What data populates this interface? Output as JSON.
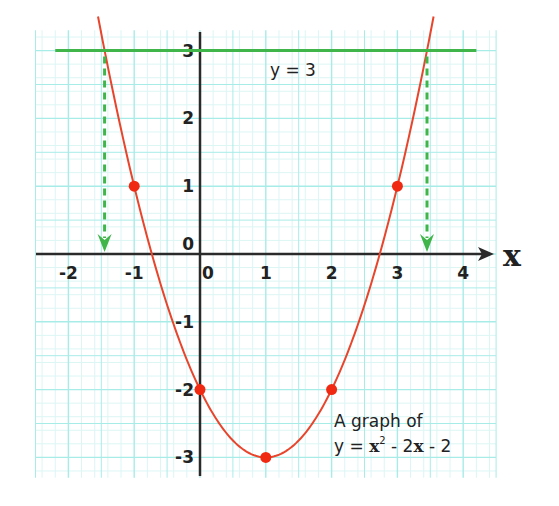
{
  "chart_data": {
    "type": "line",
    "title": "",
    "xlabel": "x",
    "ylabel": "",
    "xlim": [
      -2.5,
      4.5
    ],
    "ylim": [
      -3.3,
      3.3
    ],
    "grid": true,
    "x_ticks": [
      -2,
      -1,
      0,
      1,
      2,
      3,
      4
    ],
    "x_tick_labels": [
      "-2",
      "-1",
      "0",
      "1",
      "2",
      "3",
      "4"
    ],
    "y_ticks": [
      3,
      2,
      1,
      0,
      -1,
      -2,
      -3
    ],
    "y_tick_labels": [
      "3",
      "2",
      "1",
      "0",
      "-1",
      "-2",
      "-3"
    ],
    "series": [
      {
        "name": "y = x² - 2x - 2",
        "kind": "curve",
        "color": "#e8452c",
        "equation": "y = x^2 - 2x - 2",
        "x_range": [
          -1.55,
          3.55
        ]
      },
      {
        "name": "y = 3",
        "kind": "horizontal-line",
        "color": "#3fb54a",
        "y": 3,
        "x_range": [
          -2.2,
          4.2
        ]
      }
    ],
    "points": [
      {
        "x": -1,
        "y": 1
      },
      {
        "x": 0,
        "y": -2
      },
      {
        "x": 1,
        "y": -3
      },
      {
        "x": 2,
        "y": -2
      },
      {
        "x": 3,
        "y": 1
      }
    ],
    "point_color": "#f02a12",
    "intersections": [
      {
        "x": -1.45,
        "y": 3,
        "drop_to_axis": true
      },
      {
        "x": 3.45,
        "y": 3,
        "drop_to_axis": true
      }
    ],
    "annotations": [
      {
        "text": "y = 3",
        "x": 0.75,
        "y": 2.7
      },
      {
        "text": "A graph of",
        "x": 2.05,
        "y": -2.45
      },
      {
        "text_parts": [
          "y = x",
          "2",
          " - 2x - 2"
        ],
        "x": 2.05,
        "y": -2.85
      }
    ]
  },
  "labels": {
    "x_axis_var": "x",
    "y_origin": "0",
    "line_label": "y = 3",
    "caption_line1": "A graph of",
    "caption_line2_a": "y = ",
    "caption_line2_x": "x",
    "caption_line2_sup": "2",
    "caption_line2_b": " - 2",
    "caption_line2_x2": "x",
    "caption_line2_c": " - 2"
  },
  "colors": {
    "grid_major": "#a8ece8",
    "grid_minor": "#dcf6f4",
    "axis": "#2a2a2a",
    "curve": "#e8452c",
    "line": "#3fb54a",
    "dashed": "#3fb54a",
    "points": "#f02a12"
  }
}
